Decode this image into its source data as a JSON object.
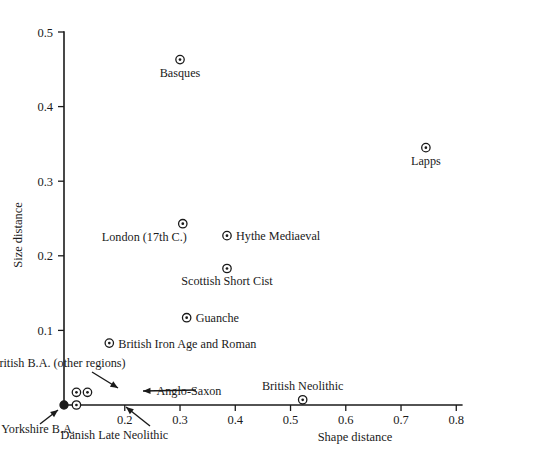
{
  "chart_data": {
    "type": "scatter",
    "title": "",
    "xlabel": "Shape distance",
    "ylabel": "Size distance",
    "xlim": [
      0.09,
      0.81
    ],
    "ylim": [
      0.0,
      0.5
    ],
    "xticks": [
      "0.2",
      "0.3",
      "0.4",
      "0.5",
      "0.6",
      "0.7",
      "0.8"
    ],
    "xtick_values": [
      0.2,
      0.3,
      0.4,
      0.5,
      0.6,
      0.7,
      0.8
    ],
    "yticks": [
      "0.1",
      "0.2",
      "0.3",
      "0.4",
      "0.5"
    ],
    "ytick_values": [
      0.1,
      0.2,
      0.3,
      0.4,
      0.5
    ],
    "grid": false,
    "legend": "none",
    "points": [
      {
        "label": "Basques",
        "x": 0.3,
        "y": 0.463,
        "marker": "target",
        "label_pos": "below"
      },
      {
        "label": "Lapps",
        "x": 0.745,
        "y": 0.345,
        "marker": "target",
        "label_pos": "below"
      },
      {
        "label": "London (17th C.)",
        "x": 0.305,
        "y": 0.243,
        "marker": "target",
        "label_pos": "below-left"
      },
      {
        "label": "Hythe Mediaeval",
        "x": 0.385,
        "y": 0.227,
        "marker": "target",
        "label_pos": "right"
      },
      {
        "label": "Scottish Short Cist",
        "x": 0.385,
        "y": 0.183,
        "marker": "target",
        "label_pos": "below"
      },
      {
        "label": "Guanche",
        "x": 0.312,
        "y": 0.117,
        "marker": "target",
        "label_pos": "right"
      },
      {
        "label": "British Iron Age and Roman",
        "x": 0.172,
        "y": 0.083,
        "marker": "target",
        "label_pos": "right"
      },
      {
        "label": "British Neolithic",
        "x": 0.522,
        "y": 0.007,
        "marker": "target",
        "label_pos": "above"
      },
      {
        "label": "Yorkshire B.A.",
        "x": 0.09,
        "y": 0.0,
        "marker": "filled",
        "label_pos": "arrow-lower-left"
      },
      {
        "label": "British B.A. (other regions)",
        "x": 0.1125,
        "y": 0.017,
        "marker": "target",
        "label_pos": "arrow-above-left"
      },
      {
        "label": "Anglo-Saxon",
        "x": 0.1325,
        "y": 0.017,
        "marker": "target",
        "label_pos": "arrow-right"
      },
      {
        "label": "Danish Late Neolithic",
        "x": 0.1125,
        "y": 0.0,
        "marker": "target",
        "label_pos": "arrow-below-right"
      }
    ],
    "annotations": [
      {
        "text": "British B.A. (other regions)",
        "arrow_from": [
          92,
          372
        ],
        "arrow_to": [
          118,
          388
        ]
      },
      {
        "text": "Anglo-Saxon",
        "arrow_from": [
          196,
          390
        ],
        "arrow_to": [
          143,
          391
        ]
      },
      {
        "text": "Yorkshire B.A.",
        "arrow_from": [
          40,
          424
        ],
        "arrow_to": [
          58,
          410
        ]
      },
      {
        "text": "Danish Late Neolithic",
        "arrow_from": [
          150,
          426
        ],
        "arrow_to": [
          126,
          407
        ]
      }
    ]
  },
  "axes": {
    "x_title": "Shape distance",
    "y_title": "Size distance"
  }
}
